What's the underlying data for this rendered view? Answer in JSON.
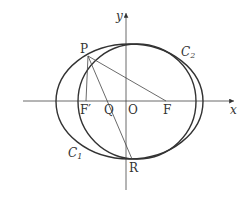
{
  "diagram": {
    "type": "geometry",
    "axes": {
      "x_label": "x",
      "y_label": "y",
      "origin_label": "O"
    },
    "curves": [
      {
        "name": "C",
        "sub": "1",
        "label": "C1",
        "kind": "ellipse"
      },
      {
        "name": "C",
        "sub": "2",
        "label": "C2",
        "kind": "ellipse"
      }
    ],
    "points": {
      "P": "P",
      "F_prime": "F′",
      "Q": "Q",
      "O": "O",
      "F": "F",
      "R": "R"
    },
    "segments": [
      "PF′",
      "PF",
      "PR"
    ],
    "colors": {
      "stroke": "#333333",
      "background": "#ffffff"
    }
  }
}
